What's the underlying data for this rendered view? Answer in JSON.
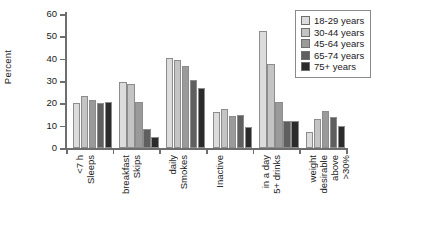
{
  "chart_data": {
    "type": "bar",
    "title": "",
    "xlabel": "",
    "ylabel": "Percent",
    "ylim": [
      0,
      60
    ],
    "yticks": [
      0,
      10,
      20,
      30,
      40,
      50,
      60
    ],
    "grid": false,
    "legend_position": "top-right",
    "categories": [
      "Sleeps <7 h",
      "Skips breakfast",
      "Smokes daily",
      "Inactive",
      "5+ drinks in a day",
      ">30% above desirable weight"
    ],
    "category_lines": [
      [
        "Sleeps",
        "<7 h"
      ],
      [
        "Skips",
        "breakfast"
      ],
      [
        "Smokes",
        "daily"
      ],
      [
        "Inactive"
      ],
      [
        "5+ drinks",
        "in a day"
      ],
      [
        ">30%",
        "above",
        "desirable",
        "weight"
      ]
    ],
    "series": [
      {
        "name": "18-29 years",
        "color": "#dcdcdc",
        "values": [
          20,
          29.5,
          40.5,
          16,
          52.5,
          7
        ]
      },
      {
        "name": "30-44 years",
        "color": "#c4c4c4",
        "values": [
          23.5,
          28.5,
          39.5,
          17.5,
          37.5,
          13
        ]
      },
      {
        "name": "45-64 years",
        "color": "#9a9a9a",
        "values": [
          21.5,
          20.5,
          36.5,
          14.5,
          20.5,
          16.5
        ]
      },
      {
        "name": "65-74 years",
        "color": "#5f5f5f",
        "values": [
          20,
          8.5,
          30.5,
          15,
          12,
          14
        ]
      },
      {
        "name": "75+ years",
        "color": "#2b2b2b",
        "values": [
          20.5,
          5,
          27,
          9.5,
          12,
          10
        ]
      }
    ]
  }
}
